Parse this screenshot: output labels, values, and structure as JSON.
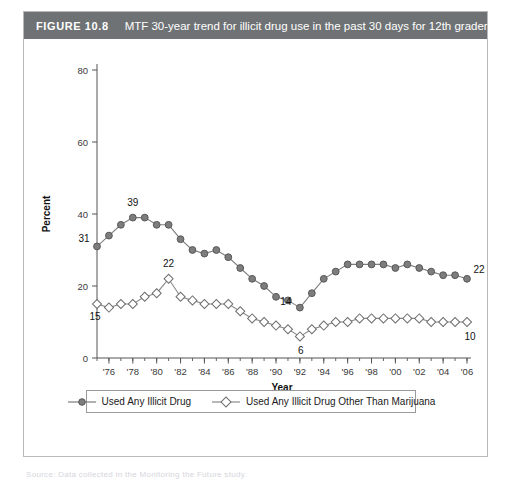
{
  "figure": {
    "number_label": "FIGURE 10.8",
    "caption": "MTF 30-year trend for illicit drug use in the past 30 days for 12th graders.",
    "header_color": "#6f7275",
    "panel_border_color": "#b9b9b9"
  },
  "legend": {
    "entries": [
      {
        "label": "Used Any Illicit Drug",
        "marker": "filled-circle",
        "color": "#7d7d7d"
      },
      {
        "label": "Used Any Illicit Drug Other Than Marijuana",
        "marker": "open-diamond",
        "color": "#8a8a8a"
      }
    ]
  },
  "source_stub": "Source: Data collected in the Monitoring the Future study.",
  "chart_data": {
    "type": "line",
    "title": "MTF 30-year trend for illicit drug use in the past 30 days for 12th graders.",
    "xlabel": "Year",
    "ylabel": "Percent",
    "ylim": [
      0,
      80
    ],
    "yticks": [
      0,
      20,
      40,
      60,
      80
    ],
    "ytick_labels": [
      "0",
      "20",
      "40",
      "60",
      "80"
    ],
    "xlim": [
      1975,
      2006
    ],
    "xticks": [
      1976,
      1978,
      1980,
      1982,
      1984,
      1986,
      1988,
      1990,
      1992,
      1994,
      1996,
      1998,
      2000,
      2002,
      2004,
      2006
    ],
    "xtick_labels": [
      "'76",
      "'78",
      "'80",
      "'82",
      "'84",
      "'86",
      "'88",
      "'90",
      "'92",
      "'94",
      "'96",
      "'98",
      "'00",
      "'02",
      "'04",
      "'06"
    ],
    "minor_xtick_interval": 1,
    "grid": false,
    "legend_position": "below-axes",
    "x": [
      1975,
      1976,
      1977,
      1978,
      1979,
      1980,
      1981,
      1982,
      1983,
      1984,
      1985,
      1986,
      1987,
      1988,
      1989,
      1990,
      1991,
      1992,
      1993,
      1994,
      1995,
      1996,
      1997,
      1998,
      1999,
      2000,
      2001,
      2002,
      2003,
      2004,
      2005,
      2006
    ],
    "series": [
      {
        "name": "Used Any Illicit Drug",
        "marker": "filled-circle",
        "color": "#7d7d7d",
        "values": [
          31,
          34,
          37,
          39,
          39,
          37,
          37,
          33,
          30,
          29,
          30,
          28,
          25,
          22,
          20,
          17,
          16,
          14,
          18,
          22,
          24,
          26,
          26,
          26,
          26,
          25,
          26,
          25,
          24,
          23,
          23,
          22
        ]
      },
      {
        "name": "Used Any Illicit Drug Other Than Marijuana",
        "marker": "open-diamond",
        "color": "#8a8a8a",
        "values": [
          15,
          14,
          15,
          15,
          17,
          18,
          22,
          17,
          16,
          15,
          15,
          15,
          13,
          11,
          10,
          9,
          8,
          6,
          8,
          9,
          10,
          10,
          11,
          11,
          11,
          11,
          11,
          11,
          10,
          10,
          10,
          10
        ]
      }
    ],
    "annotations": [
      {
        "text": "31",
        "x": 1975,
        "y": 31,
        "series": "Used Any Illicit Drug"
      },
      {
        "text": "39",
        "x": 1978,
        "y": 39,
        "series": "Used Any Illicit Drug"
      },
      {
        "text": "14",
        "x": 1992,
        "y": 14,
        "series": "Used Any Illicit Drug"
      },
      {
        "text": "22",
        "x": 2006,
        "y": 22,
        "series": "Used Any Illicit Drug"
      },
      {
        "text": "15",
        "x": 1975,
        "y": 15,
        "series": "Used Any Illicit Drug Other Than Marijuana"
      },
      {
        "text": "22",
        "x": 1981,
        "y": 22,
        "series": "Used Any Illicit Drug Other Than Marijuana"
      },
      {
        "text": "6",
        "x": 1992,
        "y": 6,
        "series": "Used Any Illicit Drug Other Than Marijuana"
      },
      {
        "text": "10",
        "x": 2006,
        "y": 10,
        "series": "Used Any Illicit Drug Other Than Marijuana"
      }
    ]
  }
}
